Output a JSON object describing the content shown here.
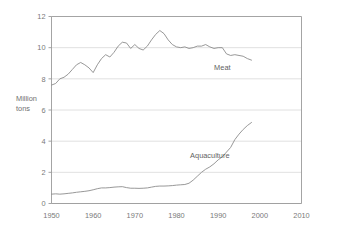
{
  "chart_data": {
    "type": "line",
    "title": "",
    "xlabel": "",
    "ylabel": "Million tons",
    "ylabel_line1": "Million",
    "ylabel_line2": "tons",
    "xlim": [
      1950,
      2010
    ],
    "ylim": [
      0,
      12
    ],
    "xticks": [
      1950,
      1960,
      1970,
      1980,
      1990,
      2000,
      2010
    ],
    "xtick_labels": [
      "1950",
      "1960",
      "1970",
      "1980",
      "1990",
      "2000",
      "2010"
    ],
    "yticks": [
      0,
      2,
      4,
      6,
      8,
      10,
      12
    ],
    "ytick_labels": [
      "0",
      "2",
      "4",
      "6",
      "8",
      "10",
      "12"
    ],
    "grid": "horizontal",
    "legend_position": "inline-labels",
    "colors": {
      "line": "#8c8c8c",
      "grid": "#d8d8d8",
      "frame": "#9a9a9a",
      "text": "#7a7a7a",
      "background": "#ffffff"
    },
    "series": [
      {
        "name": "Meat",
        "label": "Meat",
        "label_x": 1991,
        "label_y": 8.55,
        "x": [
          1950,
          1951,
          1952,
          1953,
          1954,
          1955,
          1956,
          1957,
          1958,
          1959,
          1960,
          1961,
          1962,
          1963,
          1964,
          1965,
          1966,
          1967,
          1968,
          1969,
          1970,
          1971,
          1972,
          1973,
          1974,
          1975,
          1976,
          1977,
          1978,
          1979,
          1980,
          1981,
          1982,
          1983,
          1984,
          1985,
          1986,
          1987,
          1988,
          1989,
          1990,
          1991,
          1992,
          1993,
          1994,
          1995,
          1996,
          1997,
          1998
        ],
        "values": [
          7.6,
          7.7,
          8.0,
          8.1,
          8.3,
          8.6,
          8.9,
          9.05,
          8.9,
          8.7,
          8.4,
          8.9,
          9.3,
          9.55,
          9.4,
          9.7,
          10.1,
          10.35,
          10.3,
          9.95,
          10.2,
          9.95,
          9.85,
          10.1,
          10.5,
          10.85,
          11.1,
          10.9,
          10.5,
          10.2,
          10.05,
          10.0,
          10.05,
          9.95,
          10.0,
          10.1,
          10.1,
          10.2,
          10.05,
          9.95,
          10.0,
          10.0,
          9.6,
          9.5,
          9.55,
          9.5,
          9.45,
          9.3,
          9.2
        ]
      },
      {
        "name": "Aquaculture",
        "label": "Aquaculture",
        "label_x": 1988,
        "label_y": 2.95,
        "x": [
          1950,
          1951,
          1952,
          1953,
          1954,
          1955,
          1956,
          1957,
          1958,
          1959,
          1960,
          1961,
          1962,
          1963,
          1964,
          1965,
          1966,
          1967,
          1968,
          1969,
          1970,
          1971,
          1972,
          1973,
          1974,
          1975,
          1976,
          1977,
          1978,
          1979,
          1980,
          1981,
          1982,
          1983,
          1984,
          1985,
          1986,
          1987,
          1988,
          1989,
          1990,
          1991,
          1992,
          1993,
          1994,
          1995,
          1996,
          1997,
          1998
        ],
        "values": [
          0.6,
          0.62,
          0.6,
          0.62,
          0.65,
          0.68,
          0.72,
          0.75,
          0.78,
          0.82,
          0.88,
          0.95,
          1.0,
          1.0,
          1.02,
          1.05,
          1.07,
          1.08,
          1.02,
          0.98,
          0.98,
          0.97,
          0.98,
          1.0,
          1.05,
          1.1,
          1.12,
          1.12,
          1.13,
          1.15,
          1.18,
          1.2,
          1.22,
          1.3,
          1.5,
          1.75,
          2.0,
          2.2,
          2.35,
          2.55,
          2.8,
          3.0,
          3.3,
          3.6,
          4.1,
          4.45,
          4.75,
          5.0,
          5.2
        ]
      }
    ]
  }
}
